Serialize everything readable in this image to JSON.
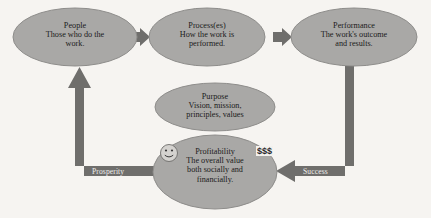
{
  "diagram": {
    "background_color": "#f6f4f1",
    "node_fill_color": "#a9a8a6",
    "node_stroke_color": "#8e8d8b",
    "connector_color": "#6f6e6c",
    "text_color": "#1b1b1b",
    "edge_label_color": "#efeeec"
  },
  "nodes": [
    {
      "id": "people",
      "title": "People",
      "description_lines": [
        "Those who do the",
        "work."
      ]
    },
    {
      "id": "processes",
      "title": "Process(es)",
      "description_lines": [
        "How the work is",
        "performed."
      ]
    },
    {
      "id": "performance",
      "title": "Performance",
      "description_lines": [
        "The work's outcome",
        "and results."
      ]
    },
    {
      "id": "purpose",
      "title": "Purpose",
      "description_lines": [
        "Vision, mission,",
        "principles, values"
      ]
    },
    {
      "id": "profitability",
      "title": "Profitability",
      "description_lines": [
        "The overall value",
        "both socially and",
        "financially."
      ]
    }
  ],
  "edges": [
    {
      "id": "people-to-process",
      "label": ""
    },
    {
      "id": "process-to-performance",
      "label": ""
    },
    {
      "id": "performance-to-profitability",
      "label": "Success"
    },
    {
      "id": "profitability-to-people",
      "label": "Prosperity"
    }
  ],
  "annotations": {
    "money": "$$$",
    "smiley": "smiley-face-icon"
  }
}
